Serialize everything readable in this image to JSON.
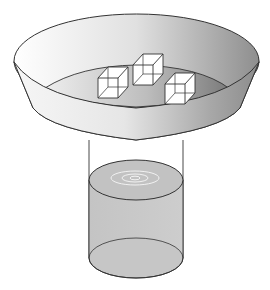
{
  "diagram": {
    "components": [
      {
        "id": "bowl",
        "label": "bowl"
      },
      {
        "id": "ice-cubes",
        "label": "ice cubes",
        "count": 3
      },
      {
        "id": "bowl-water",
        "label": "water in bowl"
      },
      {
        "id": "cylinder",
        "label": "cylinder"
      },
      {
        "id": "cylinder-water",
        "label": "water in cylinder"
      },
      {
        "id": "ripples",
        "label": "ripples",
        "rings": 3
      }
    ],
    "colors": {
      "outline": "#333333",
      "bowl_light": "#f4f4f4",
      "bowl_dark": "#8a8a8a",
      "water": "#c8c8c8",
      "water_dark": "#7f7f7f",
      "cube_fill": "#ffffff",
      "ripple": "#eeeeee"
    }
  }
}
